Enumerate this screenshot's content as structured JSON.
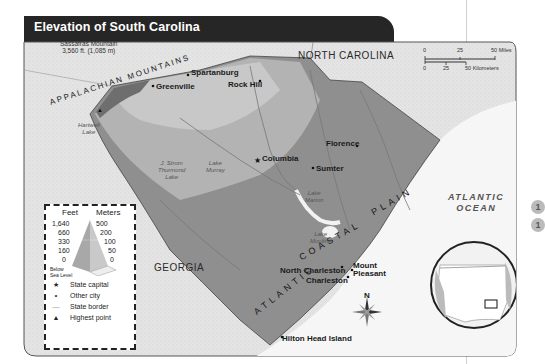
{
  "title": "Elevation of South Carolina",
  "highest_point": {
    "name": "Sassafras Mountain",
    "elevation": "3,560 ft. (1,085 m)"
  },
  "regions": {
    "appalachian": "APPALACHIAN MOUNTAINS",
    "coastal_plain_atlantic": "ATLANTIC",
    "coastal_plain_coastal": "COASTAL",
    "coastal_plain_plain": "PLAIN",
    "north_carolina_1": "NORTH",
    "north_carolina_2": "CAROLINA",
    "georgia": "GEORGIA",
    "ocean": [
      "ATLANTIC",
      "OCEAN"
    ]
  },
  "cities": {
    "capital": "Columbia",
    "others": [
      "Spartanburg",
      "Greenville",
      "Rock Hill",
      "Florence",
      "Sumter",
      "North Charleston",
      "Charleston",
      "Mount",
      "Pleasant",
      "Hilton Head Island"
    ]
  },
  "water": {
    "hartwell": [
      "Hartwell",
      "Lake"
    ],
    "thurmond": [
      "J. Strom",
      "Thurmond",
      "Lake"
    ],
    "murray": [
      "Lake",
      "Murray"
    ],
    "marion": [
      "Lake",
      "Marion"
    ],
    "moultrie": [
      "Lake",
      "Moultrie"
    ],
    "rivers": [
      "Saluda River",
      "Broad River",
      "Congaree River",
      "Wateree River",
      "Edisto River",
      "Santee River",
      "Lynches River",
      "Pee Dee River",
      "Catawba River"
    ]
  },
  "scale": {
    "miles": [
      "0",
      "25",
      "50 Miles"
    ],
    "km": [
      "0",
      "25",
      "50 Kilometers"
    ]
  },
  "compass": "N",
  "legend": {
    "feet_label": "Feet",
    "meters_label": "Meters",
    "feet": [
      "1,640",
      "660",
      "330",
      "160",
      "0"
    ],
    "meters": [
      "500",
      "200",
      "100",
      "50",
      "0"
    ],
    "below": [
      "Below",
      "Sea Level"
    ],
    "items": [
      {
        "symbol": "★",
        "label": "State capital"
      },
      {
        "symbol": "•",
        "label": "Other city"
      },
      {
        "symbol": "—",
        "label": "State border"
      },
      {
        "symbol": "▲",
        "label": "Highest point"
      }
    ]
  },
  "side_badges": [
    "1",
    "1"
  ],
  "colors": {
    "title_bar": "#262626",
    "land_outside": "#e6e6e6",
    "sc_low": "#8f8f8f",
    "sc_mid": "#b3b3b3",
    "sc_high": "#d0d0d0",
    "water": "#f4f4f4"
  }
}
